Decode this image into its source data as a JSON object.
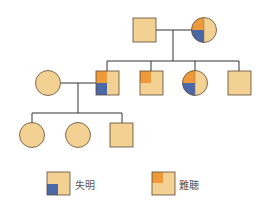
{
  "diagram": {
    "type": "pedigree",
    "colors": {
      "base": "#f3d193",
      "stroke": "#5a4a38",
      "line": "#333333",
      "blindness": "#4a68a8",
      "deafness": "#ee9a3a"
    },
    "generations": [
      {
        "members": [
          {
            "id": "g1-father",
            "sex": "male",
            "blind": false,
            "deaf": false
          },
          {
            "id": "g1-mother",
            "sex": "female",
            "blind": true,
            "deaf": true
          }
        ]
      },
      {
        "members": [
          {
            "id": "g2-spouse",
            "sex": "female",
            "blind": false,
            "deaf": false
          },
          {
            "id": "g2-son1",
            "sex": "male",
            "blind": true,
            "deaf": true
          },
          {
            "id": "g2-son2",
            "sex": "male",
            "blind": false,
            "deaf": true
          },
          {
            "id": "g2-daughter",
            "sex": "female",
            "blind": true,
            "deaf": true
          },
          {
            "id": "g2-son3",
            "sex": "male",
            "blind": false,
            "deaf": false
          }
        ]
      },
      {
        "members": [
          {
            "id": "g3-daughter1",
            "sex": "female",
            "blind": false,
            "deaf": false
          },
          {
            "id": "g3-daughter2",
            "sex": "female",
            "blind": false,
            "deaf": false
          },
          {
            "id": "g3-son",
            "sex": "male",
            "blind": false,
            "deaf": false
          }
        ]
      }
    ]
  },
  "legend": {
    "blindness_label": "失明",
    "deafness_label": "難聴"
  }
}
